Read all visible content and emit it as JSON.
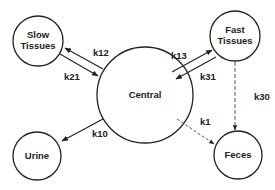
{
  "diagram": {
    "type": "compartment-model",
    "colors": {
      "stroke": "#222222",
      "background": "#ffffff",
      "text": "#222222"
    },
    "nodes": [
      {
        "id": "slow",
        "label_lines": [
          "Slow",
          "Tissues"
        ],
        "cx": 38,
        "cy": 41,
        "r": 25
      },
      {
        "id": "fast",
        "label_lines": [
          "Fast",
          "Tissues"
        ],
        "cx": 235,
        "cy": 36,
        "r": 25
      },
      {
        "id": "central",
        "label_lines": [
          "Central"
        ],
        "cx": 145,
        "cy": 95,
        "r": 48
      },
      {
        "id": "urine",
        "label_lines": [
          "Urine"
        ],
        "cx": 37,
        "cy": 156,
        "r": 24
      },
      {
        "id": "feces",
        "label_lines": [
          "Feces"
        ],
        "cx": 238,
        "cy": 155,
        "r": 24
      }
    ],
    "edges": [
      {
        "id": "k12",
        "label": "k12",
        "from": "central",
        "to": "slow",
        "style": "solid"
      },
      {
        "id": "k21",
        "label": "k21",
        "from": "slow",
        "to": "central",
        "style": "solid"
      },
      {
        "id": "k13",
        "label": "k13",
        "from": "central",
        "to": "fast",
        "style": "solid"
      },
      {
        "id": "k31",
        "label": "k31",
        "from": "fast",
        "to": "central",
        "style": "solid"
      },
      {
        "id": "k10",
        "label": "k10",
        "from": "central",
        "to": "urine",
        "style": "solid"
      },
      {
        "id": "k1",
        "label": "k1",
        "from": "central",
        "to": "feces",
        "style": "dashed"
      },
      {
        "id": "k30",
        "label": "k30",
        "from": "fast",
        "to": "feces",
        "style": "dashed"
      }
    ]
  }
}
